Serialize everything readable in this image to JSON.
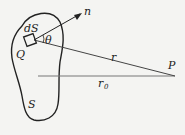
{
  "diagram": {
    "type": "geometry-figure",
    "labels": {
      "surface_element": "dS",
      "normal": "n",
      "angle": "θ",
      "point_on_surface": "Q",
      "distance": "r",
      "field_point": "P",
      "reference_distance": "r",
      "reference_distance_subscript": "0",
      "surface": "S"
    },
    "colors": {
      "stroke": "#222222",
      "background": "#f4f4f2",
      "reference_line": "#777777"
    }
  }
}
